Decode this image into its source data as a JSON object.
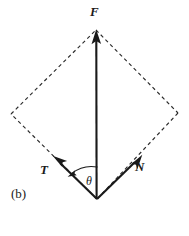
{
  "figure": {
    "panel_label": "(b)",
    "caption_style": "force-triangle-vector-diagram",
    "background_color": "#ffffff",
    "stroke_color": "#1a1a1a",
    "dash_color": "#2b2b2b",
    "width": 189,
    "height": 236
  },
  "labels": {
    "force_resultant": "F",
    "tension": "T",
    "normal": "N",
    "angle": "θ",
    "panel": "(b)"
  },
  "vectors": [
    {
      "name": "F",
      "label": "F",
      "description": "resultant force, vertical upward",
      "tail": {
        "x": 97,
        "y": 199
      },
      "tip": {
        "x": 96,
        "y": 31
      },
      "style": "solid",
      "arrowhead": "tip"
    },
    {
      "name": "T",
      "label": "T",
      "description": "tension component, up and to the left",
      "tail": {
        "x": 97,
        "y": 199
      },
      "tip": {
        "x": 53,
        "y": 156
      },
      "style": "solid",
      "arrowhead": "tip"
    },
    {
      "name": "N",
      "label": "N",
      "description": "normal component, up and to the right",
      "tail": {
        "x": 97,
        "y": 199
      },
      "tip": {
        "x": 142,
        "y": 155
      },
      "style": "solid",
      "arrowhead": "tip"
    }
  ],
  "parallelogram": {
    "description": "dashed construction rhombus showing vector addition of T and N giving F",
    "style": "dashed",
    "vertices": [
      {
        "name": "bottom",
        "x": 97,
        "y": 199
      },
      {
        "name": "left",
        "x": 11,
        "y": 114
      },
      {
        "name": "top",
        "x": 96,
        "y": 30
      },
      {
        "name": "right",
        "x": 178,
        "y": 113
      }
    ],
    "dash_pattern": "3.6 3.1"
  },
  "angle_arc": {
    "label": "θ",
    "description": "angle between the T vector and the vertical F vector, measured at the bottom vertex",
    "center": {
      "x": 97,
      "y": 199
    },
    "radius": 32,
    "start_vector": "F",
    "end_vector": "T",
    "arrowhead": "end",
    "label_position": {
      "x": 89,
      "y": 181
    }
  }
}
